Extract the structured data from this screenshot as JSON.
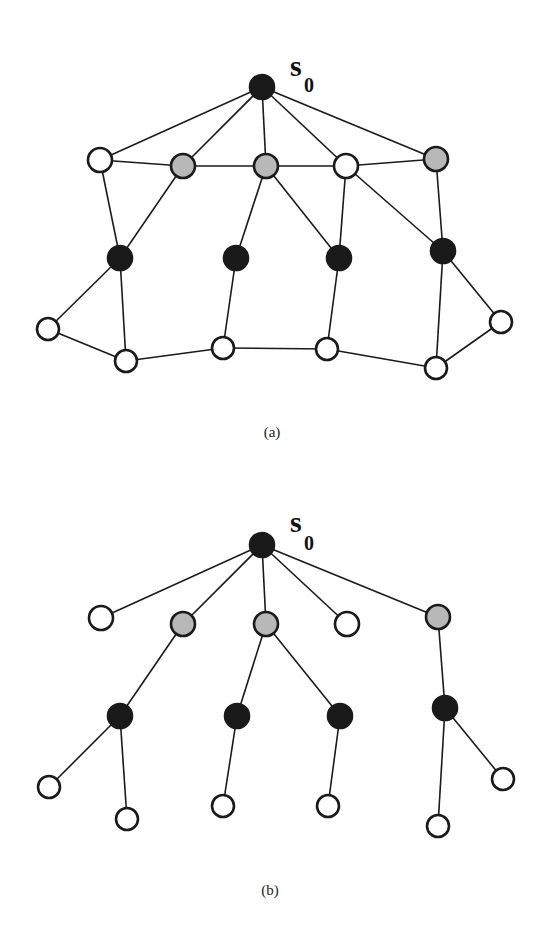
{
  "colors": {
    "black": "#1a1a1a",
    "gray": "#b8b8b8",
    "white": "#ffffff",
    "edge": "#1a1a1a"
  },
  "figures": [
    {
      "id": "a",
      "caption": "(a)",
      "caption_pos": [
        272,
        437
      ],
      "root_label": {
        "main": "s",
        "sub": "0",
        "pos": [
          290,
          76
        ],
        "sub_pos": [
          304,
          92
        ]
      },
      "nodes": [
        {
          "id": "s0",
          "x": 262,
          "y": 87,
          "r": 12,
          "fill": "black"
        },
        {
          "id": "r1a",
          "x": 100,
          "y": 160,
          "r": 12,
          "fill": "white"
        },
        {
          "id": "r1b",
          "x": 183,
          "y": 166,
          "r": 12,
          "fill": "gray"
        },
        {
          "id": "r1c",
          "x": 266,
          "y": 166,
          "r": 12,
          "fill": "gray"
        },
        {
          "id": "r1d",
          "x": 346,
          "y": 166,
          "r": 12,
          "fill": "white"
        },
        {
          "id": "r1e",
          "x": 436,
          "y": 159,
          "r": 12,
          "fill": "gray"
        },
        {
          "id": "r2a",
          "x": 120,
          "y": 258,
          "r": 12,
          "fill": "black"
        },
        {
          "id": "r2b",
          "x": 236,
          "y": 258,
          "r": 12,
          "fill": "black"
        },
        {
          "id": "r2c",
          "x": 339,
          "y": 258,
          "r": 12,
          "fill": "black"
        },
        {
          "id": "r2d",
          "x": 443,
          "y": 251,
          "r": 12,
          "fill": "black"
        },
        {
          "id": "r3a",
          "x": 48,
          "y": 329,
          "r": 11,
          "fill": "white"
        },
        {
          "id": "r3b",
          "x": 126,
          "y": 361,
          "r": 11,
          "fill": "white"
        },
        {
          "id": "r3c",
          "x": 223,
          "y": 348,
          "r": 11,
          "fill": "white"
        },
        {
          "id": "r3d",
          "x": 327,
          "y": 349,
          "r": 11,
          "fill": "white"
        },
        {
          "id": "r3e",
          "x": 436,
          "y": 368,
          "r": 11,
          "fill": "white"
        },
        {
          "id": "r3f",
          "x": 501,
          "y": 322,
          "r": 11,
          "fill": "white"
        }
      ],
      "edges": [
        [
          "s0",
          "r1a"
        ],
        [
          "s0",
          "r1b"
        ],
        [
          "s0",
          "r1c"
        ],
        [
          "s0",
          "r1d"
        ],
        [
          "s0",
          "r1e"
        ],
        [
          "r1a",
          "r1b"
        ],
        [
          "r1b",
          "r1c"
        ],
        [
          "r1c",
          "r1d"
        ],
        [
          "r1d",
          "r1e"
        ],
        [
          "r1a",
          "r2a"
        ],
        [
          "r1b",
          "r2a"
        ],
        [
          "r1c",
          "r2b"
        ],
        [
          "r1c",
          "r2c"
        ],
        [
          "r1d",
          "r2c"
        ],
        [
          "r1d",
          "r2d"
        ],
        [
          "r1e",
          "r2d"
        ],
        [
          "r2a",
          "r3a"
        ],
        [
          "r2a",
          "r3b"
        ],
        [
          "r2b",
          "r3c"
        ],
        [
          "r2c",
          "r3d"
        ],
        [
          "r2d",
          "r3f"
        ],
        [
          "r2d",
          "r3e"
        ],
        [
          "r3a",
          "r3b"
        ],
        [
          "r3b",
          "r3c"
        ],
        [
          "r3c",
          "r3d"
        ],
        [
          "r3d",
          "r3e"
        ],
        [
          "r3e",
          "r3f"
        ]
      ]
    },
    {
      "id": "b",
      "caption": "(b)",
      "caption_pos": [
        270,
        895
      ],
      "root_label": {
        "main": "s",
        "sub": "0",
        "pos": [
          290,
          532
        ],
        "sub_pos": [
          304,
          550
        ]
      },
      "nodes": [
        {
          "id": "s0",
          "x": 262,
          "y": 545,
          "r": 12,
          "fill": "black"
        },
        {
          "id": "r1a",
          "x": 101,
          "y": 618,
          "r": 12,
          "fill": "white"
        },
        {
          "id": "r1b",
          "x": 183,
          "y": 624,
          "r": 12,
          "fill": "gray"
        },
        {
          "id": "r1c",
          "x": 266,
          "y": 624,
          "r": 12,
          "fill": "gray"
        },
        {
          "id": "r1d",
          "x": 347,
          "y": 624,
          "r": 12,
          "fill": "white"
        },
        {
          "id": "r1e",
          "x": 438,
          "y": 617,
          "r": 12,
          "fill": "gray"
        },
        {
          "id": "r2a",
          "x": 120,
          "y": 716,
          "r": 12,
          "fill": "black"
        },
        {
          "id": "r2b",
          "x": 237,
          "y": 716,
          "r": 12,
          "fill": "black"
        },
        {
          "id": "r2c",
          "x": 340,
          "y": 716,
          "r": 12,
          "fill": "black"
        },
        {
          "id": "r2d",
          "x": 445,
          "y": 708,
          "r": 12,
          "fill": "black"
        },
        {
          "id": "r3a",
          "x": 49,
          "y": 787,
          "r": 11,
          "fill": "white"
        },
        {
          "id": "r3b",
          "x": 127,
          "y": 819,
          "r": 11,
          "fill": "white"
        },
        {
          "id": "r3c",
          "x": 223,
          "y": 806,
          "r": 11,
          "fill": "white"
        },
        {
          "id": "r3d",
          "x": 328,
          "y": 806,
          "r": 11,
          "fill": "white"
        },
        {
          "id": "r3e",
          "x": 438,
          "y": 826,
          "r": 11,
          "fill": "white"
        },
        {
          "id": "r3f",
          "x": 503,
          "y": 779,
          "r": 11,
          "fill": "white"
        }
      ],
      "edges": [
        [
          "s0",
          "r1a"
        ],
        [
          "s0",
          "r1b"
        ],
        [
          "s0",
          "r1c"
        ],
        [
          "s0",
          "r1d"
        ],
        [
          "s0",
          "r1e"
        ],
        [
          "r1b",
          "r2a"
        ],
        [
          "r1c",
          "r2b"
        ],
        [
          "r1c",
          "r2c"
        ],
        [
          "r1e",
          "r2d"
        ],
        [
          "r2a",
          "r3a"
        ],
        [
          "r2a",
          "r3b"
        ],
        [
          "r2b",
          "r3c"
        ],
        [
          "r2c",
          "r3d"
        ],
        [
          "r2d",
          "r3e"
        ],
        [
          "r2d",
          "r3f"
        ]
      ]
    }
  ]
}
